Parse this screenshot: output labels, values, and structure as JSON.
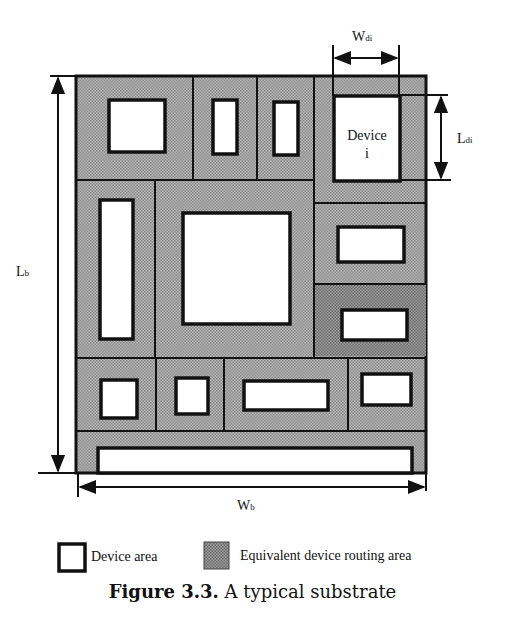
{
  "figure": {
    "caption_number": "Figure 3.3.",
    "caption_text": "A typical substrate",
    "labels": {
      "board_length": "L",
      "board_length_sub": "b",
      "board_width": "W",
      "board_width_sub": "b",
      "device_width": "W",
      "device_width_sub": "di",
      "device_length": "L",
      "device_length_sub": "di",
      "device_name_line1": "Device",
      "device_name_line2": "i"
    },
    "legend": [
      {
        "label": "Device area",
        "swatch": "white-box"
      },
      {
        "label": "Equivalent device routing area",
        "swatch": "shaded-box"
      }
    ],
    "colors": {
      "routing_area": "#a9a9a9",
      "routing_area_dark": "#8a8a8a",
      "device_area": "#ffffff",
      "outline": "#111111"
    }
  }
}
